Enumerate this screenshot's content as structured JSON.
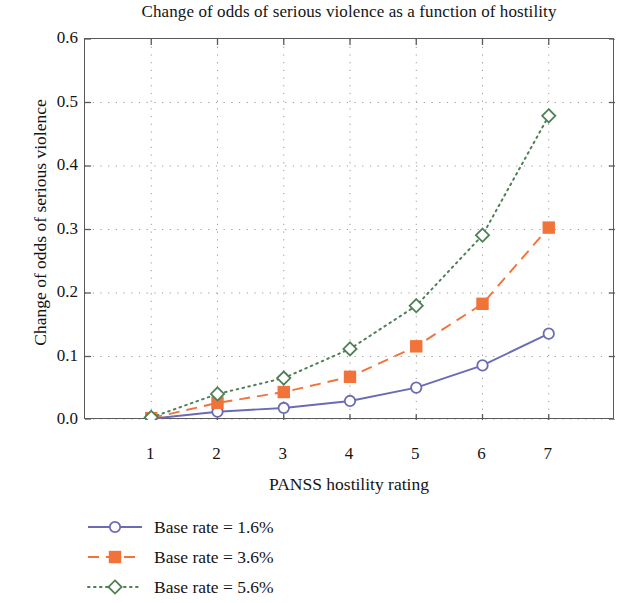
{
  "chart_data": {
    "type": "line",
    "title": "Change of odds of serious violence as a function of hostility",
    "xlabel": "PANSS hostility rating",
    "ylabel": "Change of odds of serious violence",
    "x": [
      1,
      2,
      3,
      4,
      5,
      6,
      7
    ],
    "xticklabels": [
      "1",
      "2",
      "3",
      "4",
      "5",
      "6",
      "7"
    ],
    "yticklabels": [
      "0.0",
      "0.1",
      "0.2",
      "0.3",
      "0.4",
      "0.5",
      "0.6"
    ],
    "yticks": [
      0.0,
      0.1,
      0.2,
      0.3,
      0.4,
      0.5,
      0.6
    ],
    "xlim": [
      0.0,
      8.0
    ],
    "ylim": [
      0.0,
      0.6
    ],
    "grid": "dotted",
    "legend_position": "below-left",
    "series": [
      {
        "name": "Base rate = 1.6%",
        "color": "#6B6BB5",
        "marker": "circle-open",
        "linestyle": "solid",
        "values": [
          0.002,
          0.013,
          0.019,
          0.03,
          0.051,
          0.086,
          0.136
        ]
      },
      {
        "name": "Base rate = 3.6%",
        "color": "#F2733A",
        "marker": "square-filled",
        "linestyle": "dashed",
        "values": [
          0.003,
          0.027,
          0.044,
          0.068,
          0.116,
          0.183,
          0.303
        ]
      },
      {
        "name": "Base rate = 5.6%",
        "color": "#4F8055",
        "marker": "diamond-open",
        "linestyle": "dotted",
        "values": [
          0.004,
          0.041,
          0.066,
          0.112,
          0.18,
          0.291,
          0.479
        ]
      }
    ]
  },
  "legend": {
    "items": [
      {
        "label": "Base rate = 1.6%"
      },
      {
        "label": "Base rate = 3.6%"
      },
      {
        "label": "Base rate = 5.6%"
      }
    ]
  }
}
